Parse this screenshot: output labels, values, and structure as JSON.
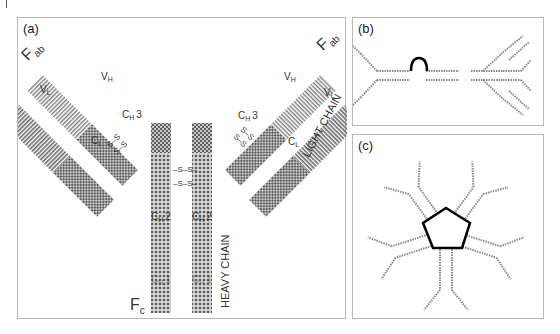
{
  "figure": {
    "panels": [
      {
        "id": "a",
        "label": "(a)"
      },
      {
        "id": "b",
        "label": "(b)"
      },
      {
        "id": "c",
        "label": "(c)"
      }
    ],
    "panel_a": {
      "fab_left": {
        "main": "F",
        "sub": "ab"
      },
      "fab_right": {
        "main": "F",
        "sub": "ab"
      },
      "fc": {
        "main": "F",
        "sub": "c"
      },
      "vl_left": {
        "main": "V",
        "sub": "L"
      },
      "vh_left": {
        "main": "V",
        "sub": "H"
      },
      "ch3_left": {
        "main": "C",
        "sub": "H",
        "suffix": "3"
      },
      "cl_left": {
        "main": "C",
        "sub": "L"
      },
      "vh_right": {
        "main": "V",
        "sub": "H"
      },
      "vl_right": {
        "main": "V",
        "sub": "L"
      },
      "ch3_right": {
        "main": "C",
        "sub": "H",
        "suffix": "3"
      },
      "cl_right": {
        "main": "C",
        "sub": "L"
      },
      "ch2_left": {
        "main": "C",
        "sub": "H",
        "suffix": "2"
      },
      "ch2_right": {
        "main": "C",
        "sub": "H",
        "suffix": "2"
      },
      "ch1_left": {
        "main": "C",
        "sub": "H",
        "suffix": "1"
      },
      "ch1_right": {
        "main": "C",
        "sub": "H",
        "suffix": "1"
      },
      "disulfide": "S–S",
      "light_chain": "LIGHT CHAIN",
      "heavy_chain": "HEAVY CHAIN"
    },
    "colors": {
      "border": "#b8b8b8",
      "stripe": "#8a8a8a",
      "checker": "#7a7a7a",
      "outline": "#000000"
    }
  }
}
